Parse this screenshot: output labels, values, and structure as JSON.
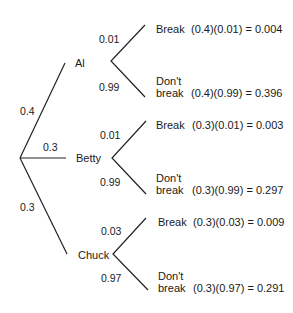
{
  "tree": {
    "root_branches": [
      {
        "name": "Al",
        "prob": "0.4"
      },
      {
        "name": "Betty",
        "prob": "0.3"
      },
      {
        "name": "Chuck",
        "prob": "0.3"
      }
    ],
    "sub": [
      {
        "up_prob": "0.01",
        "down_prob": "0.99",
        "up_label": "Break",
        "down_label_1": "Don't",
        "down_label_2": "break",
        "up_calc": "(0.4)(0.01) = 0.004",
        "down_calc": "(0.4)(0.99) = 0.396"
      },
      {
        "up_prob": "0.01",
        "down_prob": "0.99",
        "up_label": "Break",
        "down_label_1": "Don't",
        "down_label_2": "break",
        "up_calc": "(0.3)(0.01) = 0.003",
        "down_calc": "(0.3)(0.99) = 0.297"
      },
      {
        "up_prob": "0.03",
        "down_prob": "0.97",
        "up_label": "Break",
        "down_label_1": "Don't",
        "down_label_2": "break",
        "up_calc": "(0.3)(0.03) = 0.009",
        "down_calc": "(0.3)(0.97) = 0.291"
      }
    ]
  }
}
